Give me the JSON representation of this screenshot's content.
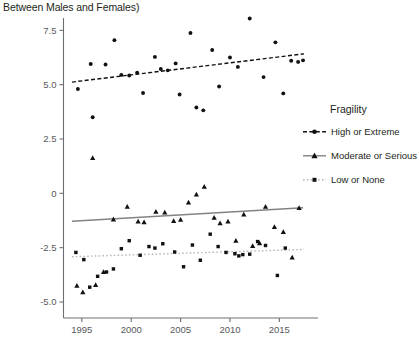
{
  "title": "Between Males and Females)",
  "legend": {
    "title": "Fragility",
    "items": [
      {
        "label": "High or Extreme",
        "marker": "circle",
        "line": "dashed",
        "color": "#111111"
      },
      {
        "label": "Moderate or Serious",
        "marker": "triangle",
        "line": "solid",
        "color": "#6d6e71"
      },
      {
        "label": "Low or None",
        "marker": "square",
        "line": "dotted",
        "color": "#a7a9ac"
      }
    ]
  },
  "chart_data": {
    "type": "scatter",
    "title": "Between Males and Females)",
    "xlabel": "",
    "ylabel": "",
    "xlim": [
      1993.6,
      2017.8
    ],
    "ylim": [
      -5.6,
      8.3
    ],
    "xticks": [
      1995,
      2000,
      2005,
      2010,
      2015
    ],
    "yticks": [
      7.5,
      5.0,
      2.5,
      0,
      -2.5,
      -5.0
    ],
    "ytick_labels": [
      "7.5",
      "5.0",
      "2.5",
      "0",
      "-2.5",
      "-5.0"
    ],
    "grid": false,
    "legend_position": "right",
    "series": [
      {
        "name": "High or Extreme",
        "marker": "circle",
        "color": "#111111",
        "trendline": {
          "style": "dashed",
          "x": [
            1994.0,
            2017.5
          ],
          "y": [
            5.12,
            6.42
          ]
        },
        "points": [
          {
            "x": 1994.6,
            "y": 4.8
          },
          {
            "x": 1995.9,
            "y": 5.95
          },
          {
            "x": 1996.1,
            "y": 3.5
          },
          {
            "x": 1997.4,
            "y": 5.93
          },
          {
            "x": 1998.3,
            "y": 7.05
          },
          {
            "x": 1999.0,
            "y": 5.45
          },
          {
            "x": 1999.8,
            "y": 5.42
          },
          {
            "x": 2000.6,
            "y": 5.55
          },
          {
            "x": 2001.2,
            "y": 4.62
          },
          {
            "x": 2002.4,
            "y": 6.28
          },
          {
            "x": 2003.0,
            "y": 5.72
          },
          {
            "x": 2003.7,
            "y": 5.66
          },
          {
            "x": 2004.5,
            "y": 5.98
          },
          {
            "x": 2004.9,
            "y": 4.55
          },
          {
            "x": 2006.0,
            "y": 7.38
          },
          {
            "x": 2006.6,
            "y": 3.95
          },
          {
            "x": 2007.3,
            "y": 3.82
          },
          {
            "x": 2008.2,
            "y": 6.6
          },
          {
            "x": 2008.9,
            "y": 4.92
          },
          {
            "x": 2010.0,
            "y": 6.25
          },
          {
            "x": 2010.8,
            "y": 5.82
          },
          {
            "x": 2012.0,
            "y": 8.05
          },
          {
            "x": 2013.4,
            "y": 5.35
          },
          {
            "x": 2014.6,
            "y": 6.95
          },
          {
            "x": 2015.4,
            "y": 4.6
          },
          {
            "x": 2016.2,
            "y": 6.1
          },
          {
            "x": 2016.9,
            "y": 6.05
          },
          {
            "x": 2017.4,
            "y": 6.12
          }
        ]
      },
      {
        "name": "Moderate or Serious",
        "marker": "triangle",
        "color": "#6d6e71",
        "trendline": {
          "style": "solid",
          "x": [
            1994.0,
            2017.4
          ],
          "y": [
            -1.28,
            -0.66
          ]
        },
        "points": [
          {
            "x": 1994.5,
            "y": -4.25
          },
          {
            "x": 1995.1,
            "y": -4.55
          },
          {
            "x": 1996.1,
            "y": 1.62
          },
          {
            "x": 1996.4,
            "y": -4.22
          },
          {
            "x": 1997.2,
            "y": -3.62
          },
          {
            "x": 1998.2,
            "y": -1.2
          },
          {
            "x": 1999.6,
            "y": -0.62
          },
          {
            "x": 2000.7,
            "y": -1.3
          },
          {
            "x": 2001.3,
            "y": -1.33
          },
          {
            "x": 2002.5,
            "y": -0.85
          },
          {
            "x": 2003.4,
            "y": -0.88
          },
          {
            "x": 2004.3,
            "y": -1.28
          },
          {
            "x": 2005.0,
            "y": -1.22
          },
          {
            "x": 2005.8,
            "y": -0.42
          },
          {
            "x": 2006.6,
            "y": -0.05
          },
          {
            "x": 2007.4,
            "y": 0.3
          },
          {
            "x": 2008.4,
            "y": -1.12
          },
          {
            "x": 2009.0,
            "y": -1.38
          },
          {
            "x": 2009.8,
            "y": -1.3
          },
          {
            "x": 2010.6,
            "y": -2.18
          },
          {
            "x": 2011.4,
            "y": -0.98
          },
          {
            "x": 2012.3,
            "y": -2.42
          },
          {
            "x": 2013.0,
            "y": -2.3
          },
          {
            "x": 2013.6,
            "y": -0.62
          },
          {
            "x": 2014.5,
            "y": -1.55
          },
          {
            "x": 2015.4,
            "y": -1.78
          },
          {
            "x": 2016.3,
            "y": -2.95
          },
          {
            "x": 2017.0,
            "y": -0.68
          }
        ]
      },
      {
        "name": "Low or None",
        "marker": "square",
        "color": "#a7a9ac",
        "trendline": {
          "style": "dotted",
          "x": [
            1994.0,
            2017.5
          ],
          "y": [
            -2.92,
            -2.58
          ]
        },
        "points": [
          {
            "x": 1994.4,
            "y": -2.72
          },
          {
            "x": 1995.2,
            "y": -3.05
          },
          {
            "x": 1995.8,
            "y": -4.32
          },
          {
            "x": 1996.6,
            "y": -3.82
          },
          {
            "x": 1997.5,
            "y": -3.62
          },
          {
            "x": 1998.2,
            "y": -3.48
          },
          {
            "x": 1999.0,
            "y": -2.55
          },
          {
            "x": 1999.8,
            "y": -2.18
          },
          {
            "x": 2000.9,
            "y": -2.85
          },
          {
            "x": 2001.8,
            "y": -2.45
          },
          {
            "x": 2002.4,
            "y": -2.52
          },
          {
            "x": 2003.2,
            "y": -2.32
          },
          {
            "x": 2004.4,
            "y": -2.7
          },
          {
            "x": 2005.3,
            "y": -3.38
          },
          {
            "x": 2006.2,
            "y": -2.38
          },
          {
            "x": 2007.0,
            "y": -3.08
          },
          {
            "x": 2008.0,
            "y": -1.88
          },
          {
            "x": 2008.8,
            "y": -2.45
          },
          {
            "x": 2009.6,
            "y": -2.72
          },
          {
            "x": 2010.5,
            "y": -2.78
          },
          {
            "x": 2010.9,
            "y": -2.88
          },
          {
            "x": 2011.3,
            "y": -2.82
          },
          {
            "x": 2012.0,
            "y": -2.8
          },
          {
            "x": 2012.8,
            "y": -2.22
          },
          {
            "x": 2013.6,
            "y": -2.4
          },
          {
            "x": 2014.8,
            "y": -3.78
          },
          {
            "x": 2015.6,
            "y": -2.52
          }
        ]
      }
    ]
  }
}
